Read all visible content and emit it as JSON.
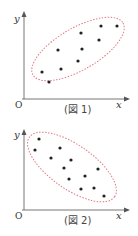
{
  "figures": [
    {
      "id": "fig1",
      "caption": "(図 1)",
      "axis_x": "x",
      "axis_y": "y",
      "origin": "O",
      "correlation": "positive",
      "ellipse_color": "#e05a6a",
      "points": [
        [
          42,
          72
        ],
        [
          49,
          82
        ],
        [
          58,
          50
        ],
        [
          61,
          69
        ],
        [
          78,
          62
        ],
        [
          81,
          33
        ],
        [
          82,
          49
        ],
        [
          99,
          40
        ],
        [
          101,
          25
        ],
        [
          117,
          25
        ]
      ]
    },
    {
      "id": "fig2",
      "caption": "(図 2)",
      "axis_x": "x",
      "axis_y": "y",
      "origin": "O",
      "correlation": "negative",
      "ellipse_color": "#e05a6a",
      "points": [
        [
          39,
          138
        ],
        [
          35,
          149
        ],
        [
          60,
          148
        ],
        [
          51,
          158
        ],
        [
          71,
          160
        ],
        [
          64,
          168
        ],
        [
          69,
          179
        ],
        [
          85,
          176
        ],
        [
          98,
          169
        ],
        [
          81,
          189
        ],
        [
          94,
          188
        ],
        [
          104,
          196
        ]
      ]
    }
  ]
}
